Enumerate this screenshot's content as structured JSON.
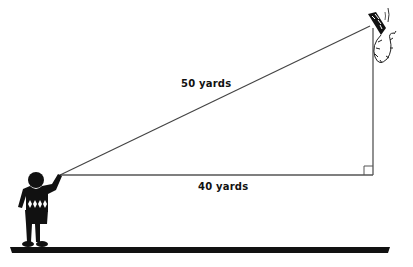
{
  "diagram": {
    "hypotenuse_label": "50 yards",
    "base_label": "40 yards",
    "figures": [
      "boy-flying-kite",
      "kite-with-tail"
    ],
    "right_angle_marker": true,
    "colors": {
      "line": "#555555",
      "ink": "#111111",
      "background": "#ffffff"
    }
  }
}
